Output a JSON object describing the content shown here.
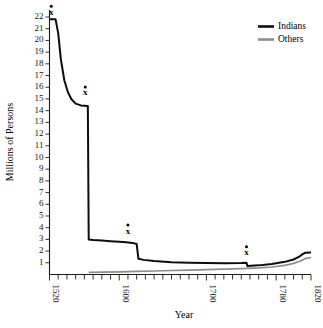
{
  "chart_data": {
    "type": "line",
    "title": "",
    "xlabel": "Year",
    "ylabel": "Millions of Persons",
    "xlim": [
      1520,
      1820
    ],
    "ylim": [
      0,
      22.6
    ],
    "grid": false,
    "legend_position": "top-right",
    "x_major_ticks": [
      1520,
      1600,
      1700,
      1780,
      1820
    ],
    "x_major_tick_labels": [
      "1520",
      "1600",
      "1700",
      "1780",
      "1820"
    ],
    "x_minor_tick_step": 10,
    "y_ticks": [
      1,
      2,
      3,
      4,
      5,
      6,
      7,
      8,
      9,
      10,
      11,
      12,
      13,
      14,
      15,
      16,
      17,
      18,
      19,
      20,
      21,
      22
    ],
    "y_tick_labels": [
      "1",
      "2",
      "3",
      "4",
      "5",
      "6",
      "7",
      "8",
      "9",
      "10",
      "11",
      "12",
      "13",
      "14",
      "15",
      "16",
      "17",
      "18",
      "19",
      "20",
      "21",
      "22"
    ],
    "series": [
      {
        "name": "Indians",
        "color": "#0d0d0d",
        "points": [
          [
            1520,
            21.8
          ],
          [
            1527,
            21.8
          ],
          [
            1530,
            20.6
          ],
          [
            1533,
            18.4
          ],
          [
            1537,
            16.6
          ],
          [
            1541,
            15.6
          ],
          [
            1545,
            15.0
          ],
          [
            1550,
            14.6
          ],
          [
            1556,
            14.45
          ],
          [
            1564,
            14.4
          ],
          [
            1565,
            3.0
          ],
          [
            1570,
            2.95
          ],
          [
            1580,
            2.9
          ],
          [
            1590,
            2.85
          ],
          [
            1600,
            2.8
          ],
          [
            1608,
            2.75
          ],
          [
            1615,
            2.7
          ],
          [
            1620,
            2.6
          ],
          [
            1622,
            1.35
          ],
          [
            1628,
            1.25
          ],
          [
            1640,
            1.15
          ],
          [
            1660,
            1.05
          ],
          [
            1680,
            1.0
          ],
          [
            1700,
            0.98
          ],
          [
            1720,
            0.97
          ],
          [
            1740,
            0.98
          ],
          [
            1746,
            1.0
          ],
          [
            1747,
            0.72
          ],
          [
            1760,
            0.78
          ],
          [
            1775,
            0.9
          ],
          [
            1790,
            1.08
          ],
          [
            1800,
            1.28
          ],
          [
            1806,
            1.5
          ],
          [
            1810,
            1.72
          ],
          [
            1813,
            1.85
          ],
          [
            1820,
            1.88
          ]
        ]
      },
      {
        "name": "Others",
        "color": "#8c8c8c",
        "points": [
          [
            1565,
            0.18
          ],
          [
            1580,
            0.2
          ],
          [
            1600,
            0.23
          ],
          [
            1620,
            0.26
          ],
          [
            1640,
            0.3
          ],
          [
            1660,
            0.34
          ],
          [
            1680,
            0.38
          ],
          [
            1700,
            0.42
          ],
          [
            1720,
            0.46
          ],
          [
            1740,
            0.5
          ],
          [
            1760,
            0.56
          ],
          [
            1775,
            0.64
          ],
          [
            1790,
            0.78
          ],
          [
            1800,
            0.95
          ],
          [
            1808,
            1.15
          ],
          [
            1813,
            1.35
          ],
          [
            1820,
            1.45
          ]
        ]
      }
    ],
    "annotations": [
      {
        "label": "x",
        "x": 1522,
        "y": 22.2,
        "series": "Indians"
      },
      {
        "label": "x",
        "x": 1561,
        "y": 15.3,
        "series": "Indians"
      },
      {
        "label": "x",
        "x": 1610,
        "y": 3.5,
        "series": "Indians"
      },
      {
        "label": "x",
        "x": 1746,
        "y": 1.65,
        "series": "Indians"
      }
    ]
  },
  "legend": {
    "items": [
      {
        "label": "Indians",
        "color": "#0d0d0d"
      },
      {
        "label": "Others",
        "color": "#8c8c8c"
      }
    ]
  },
  "axes": {
    "x_title": "Year",
    "y_title": "Millions of Persons"
  }
}
